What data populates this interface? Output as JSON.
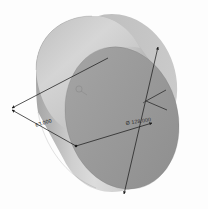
{
  "view": {
    "title": "Cylinder isometric dimensioned view",
    "background_color": "#fdfdfd"
  },
  "model": {
    "name": "cylinder-solid",
    "shape": "cylinder",
    "colors": {
      "body_light": "#d2d2d2",
      "body_mid": "#b9b9b9",
      "body_shadow": "#a2a2a2",
      "front_face": "#9a9a9a",
      "front_face_dark": "#8e8e8e",
      "edge": "#7d7d7d"
    }
  },
  "dimensions": [
    {
      "id": "length",
      "label": "63.000",
      "kind": "linear",
      "value": 63.0,
      "unit": "mm"
    },
    {
      "id": "diameter",
      "label": "Ø 128.000",
      "kind": "diameter",
      "value": 128.0,
      "unit": "mm",
      "symbol": "Ø"
    }
  ],
  "annotations": [
    {
      "id": "center-mark",
      "label": "⌕"
    }
  ]
}
